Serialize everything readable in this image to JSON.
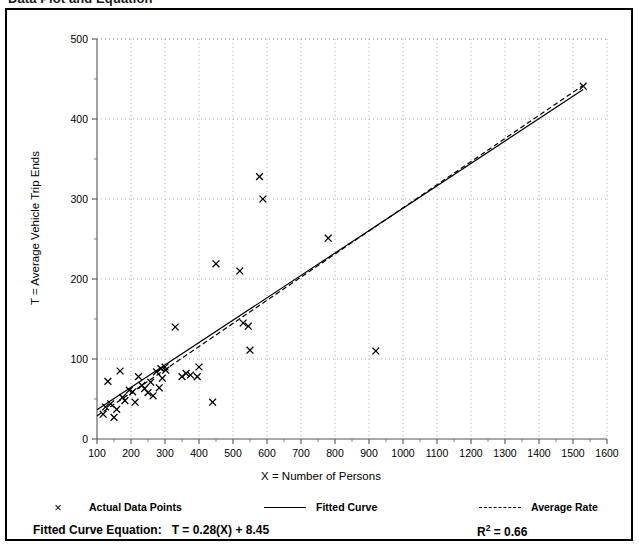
{
  "document": {
    "title": "Data Plot and Equation"
  },
  "chart_data": {
    "type": "scatter",
    "title": "Data Plot and Equation",
    "xlabel": "X = Number of Persons",
    "ylabel": "T = Average Vehicle Trip Ends",
    "xlim": [
      100,
      1600
    ],
    "ylim": [
      0,
      500
    ],
    "xticks": [
      100,
      200,
      300,
      400,
      500,
      600,
      700,
      800,
      900,
      1000,
      1100,
      1200,
      1300,
      1400,
      1500,
      1600
    ],
    "yticks": [
      0,
      100,
      200,
      300,
      400,
      500
    ],
    "x_minor_step": 50,
    "y_minor_step": 50,
    "grid": true,
    "grid_style": "dotted",
    "legend_position": "below-plot",
    "series": [
      {
        "name": "Actual Data Points",
        "type": "scatter",
        "marker": "x",
        "color": "#000000",
        "points": [
          [
            118,
            31
          ],
          [
            125,
            40
          ],
          [
            132,
            72
          ],
          [
            140,
            44
          ],
          [
            150,
            27
          ],
          [
            158,
            37
          ],
          [
            168,
            85
          ],
          [
            175,
            52
          ],
          [
            182,
            48
          ],
          [
            195,
            61
          ],
          [
            205,
            59
          ],
          [
            212,
            46
          ],
          [
            222,
            78
          ],
          [
            232,
            67
          ],
          [
            240,
            63
          ],
          [
            250,
            58
          ],
          [
            258,
            71
          ],
          [
            265,
            54
          ],
          [
            275,
            84
          ],
          [
            283,
            64
          ],
          [
            288,
            88
          ],
          [
            292,
            76
          ],
          [
            300,
            90
          ],
          [
            302,
            86
          ],
          [
            330,
            140
          ],
          [
            350,
            78
          ],
          [
            362,
            82
          ],
          [
            375,
            80
          ],
          [
            395,
            78
          ],
          [
            400,
            90
          ],
          [
            440,
            46
          ],
          [
            450,
            219
          ],
          [
            520,
            210
          ],
          [
            530,
            145
          ],
          [
            545,
            141
          ],
          [
            550,
            111
          ],
          [
            578,
            328
          ],
          [
            588,
            300
          ],
          [
            780,
            251
          ],
          [
            920,
            110
          ],
          [
            1530,
            441
          ]
        ]
      },
      {
        "name": "Fitted Curve",
        "type": "line",
        "style": "solid",
        "color": "#000000",
        "equation": "T = 0.28(X) + 8.45",
        "slope": 0.28,
        "intercept": 8.45,
        "x_from": 100,
        "x_to": 1530
      },
      {
        "name": "Average Rate",
        "type": "line",
        "style": "dashed",
        "color": "#000000",
        "slope": 0.289,
        "intercept": 0,
        "x_from": 100,
        "x_to": 1530
      }
    ],
    "annotations": {
      "equation_label": "Fitted Curve Equation:",
      "equation_value": "T = 0.28(X) + 8.45",
      "r_squared_label": "R",
      "r_squared_sup": "2",
      "r_squared_value": "= 0.66"
    }
  },
  "legend": [
    {
      "key": "x-marker-icon",
      "label": "Actual Data Points"
    },
    {
      "key": "solid-line-icon",
      "label": "Fitted Curve"
    },
    {
      "key": "dashed-line-icon",
      "label": "Average Rate"
    }
  ]
}
